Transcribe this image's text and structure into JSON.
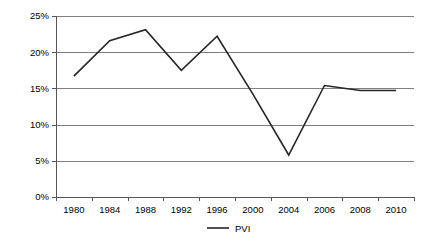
{
  "chart_data": {
    "type": "line",
    "title": "",
    "subtitle": "",
    "xlabel": "",
    "ylabel": "",
    "categories": [
      "1980",
      "1984",
      "1988",
      "1992",
      "1996",
      "2000",
      "2004",
      "2006",
      "2008",
      "2010"
    ],
    "series": [
      {
        "name": "PVI",
        "values": [
          16.7,
          21.6,
          23.1,
          17.5,
          22.2,
          14.2,
          5.8,
          15.4,
          14.7,
          14.7
        ],
        "color": "#262626"
      }
    ],
    "ylim": [
      0,
      25
    ],
    "ytick_values": [
      0,
      5,
      10,
      15,
      20,
      25
    ],
    "ytick_labels": [
      "0%",
      "5%",
      "10%",
      "15%",
      "20%",
      "25%"
    ],
    "grid": true,
    "grid_axis": "y",
    "legend": {
      "position": "bottom",
      "entries": [
        {
          "label": "PVI",
          "marker": "line",
          "color": "#262626"
        }
      ]
    },
    "annotations": [],
    "colors": {
      "background": "#ffffff",
      "gridline": "#808080",
      "axis": "#555555",
      "text": "#000000",
      "series_pvi": "#262626"
    }
  },
  "layout": {
    "plot_left": 56,
    "plot_right": 414,
    "plot_top": 16,
    "plot_bottom": 197,
    "value_top": 25,
    "value_bottom": 0
  }
}
